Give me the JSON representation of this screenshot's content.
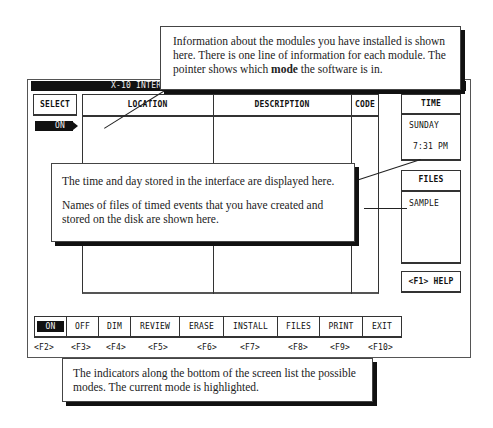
{
  "window": {
    "title": "X-10 INTERFA"
  },
  "select": {
    "header": "SELECT",
    "pointer_label": "ON"
  },
  "module_table": {
    "columns": [
      "LOCATION",
      "DESCRIPTION",
      "CODE"
    ],
    "rows": []
  },
  "time_panel": {
    "header": "TIME",
    "day": "SUNDAY",
    "time": "7:31 PM"
  },
  "files_panel": {
    "header": "FILES",
    "items": [
      "SAMPLE"
    ]
  },
  "help": {
    "label": "<F1> HELP"
  },
  "modes": {
    "active": "ON",
    "items": [
      {
        "label": "ON",
        "key": "<F2>"
      },
      {
        "label": "OFF",
        "key": "<F3>"
      },
      {
        "label": "DIM",
        "key": "<F4>"
      },
      {
        "label": "REVIEW",
        "key": "<F5>"
      },
      {
        "label": "ERASE",
        "key": "<F6>"
      },
      {
        "label": "INSTALL",
        "key": "<F7>"
      },
      {
        "label": "FILES",
        "key": "<F8>"
      },
      {
        "label": "PRINT",
        "key": "<F9>"
      },
      {
        "label": "EXIT",
        "key": "<F10>"
      }
    ]
  },
  "callouts": {
    "top": {
      "text_before": "Information about the modules you have installed is shown here. There is one line of information for each module. The pointer shows which ",
      "bold": "mode",
      "text_after": " the software is in."
    },
    "middle": {
      "time_text": "The time and day stored in the interface are displayed here.",
      "files_text": "Names of files of timed events that you have created and stored on the disk are shown here."
    },
    "bottom": {
      "text": "The indicators along the bottom of the screen list the possible modes. The current mode is highlighted."
    }
  }
}
